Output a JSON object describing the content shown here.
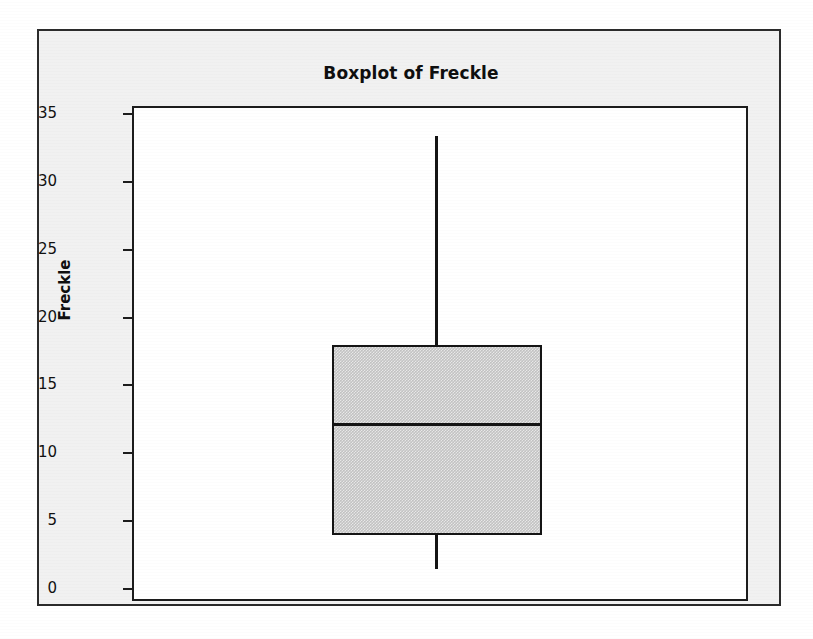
{
  "chart_data": {
    "type": "box",
    "title": "Boxplot of Freckle",
    "xlabel": "",
    "ylabel": "Freckle",
    "ylim": [
      -0.6,
      35.6
    ],
    "yticks": [
      0,
      5,
      10,
      15,
      20,
      25,
      30,
      35
    ],
    "ytick_labels": [
      "0",
      "5",
      "10",
      "15",
      "20",
      "25",
      "30",
      "35"
    ],
    "grid": false,
    "legend": null,
    "categories": [
      "Freckle"
    ],
    "boxes": [
      {
        "name": "Freckle",
        "whisker_low": 1.6,
        "q1": 4.1,
        "median": 12.4,
        "q3": 18.1,
        "whisker_high": 33.5,
        "outliers": [],
        "fill_color": "#c3c3c3",
        "line_color": "#141414"
      }
    ]
  },
  "figure": {
    "title": "Boxplot of Freckle",
    "yaxis_title": "Freckle",
    "tick_labels": [
      "35",
      "30",
      "25",
      "20",
      "15",
      "10",
      "5",
      "0"
    ],
    "background_color": "#f1f1f1",
    "panel_color": "#ffffff",
    "frame_color": "#2b2b2b"
  }
}
